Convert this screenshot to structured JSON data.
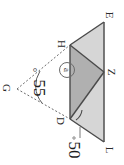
{
  "figure": {
    "type": "geometry-diagram",
    "orientation": "rotated-90-clockwise",
    "background_color": "#ffffff",
    "stroke_color": "#4a4a4a",
    "fill_light": "#d6d6d6",
    "fill_dark": "#b0b0b0",
    "vertices": [
      {
        "name": "vertex-E",
        "label": "E"
      },
      {
        "name": "vertex-H",
        "label": "H"
      },
      {
        "name": "vertex-Z",
        "label": "Z"
      },
      {
        "name": "vertex-D",
        "label": "D"
      },
      {
        "name": "vertex-G",
        "label": "G"
      },
      {
        "name": "vertex-L",
        "label": "L"
      }
    ],
    "angles": [
      {
        "name": "angle-55",
        "value": "55",
        "degree_symbol": "°"
      },
      {
        "name": "angle-50",
        "value": "50",
        "degree_symbol": "°"
      }
    ],
    "region_label": {
      "name": "circled-region-label",
      "text": "a"
    }
  }
}
